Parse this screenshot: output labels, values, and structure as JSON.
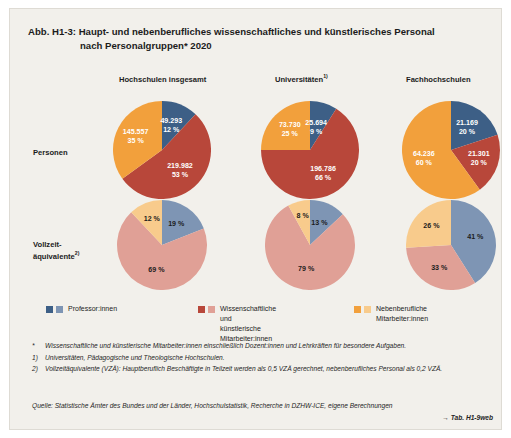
{
  "figure": {
    "number": "Abb. H1-3:",
    "title_line1": "Haupt- und nebenberufliches wissenschaftliches und künstlerisches Personal",
    "title_line2": "nach Personalgruppen* 2020"
  },
  "columns": [
    {
      "label": "Hochschulen insgesamt",
      "sup": ""
    },
    {
      "label": "Universitäten",
      "sup": "1)"
    },
    {
      "label": "Fachhochschulen",
      "sup": ""
    }
  ],
  "rows": [
    {
      "label_line1": "Personen",
      "label_line2": "",
      "sup": ""
    },
    {
      "label_line1": "Vollzeit-",
      "label_line2": "äquivalente",
      "sup": "2)"
    }
  ],
  "legend": [
    {
      "label": "Professor:innen",
      "color_dark": "#3d5f86",
      "color_light": "#7e95b4"
    },
    {
      "label": "Wissenschaftliche und\nkünstlerische Mitarbeiter:innen",
      "color_dark": "#b8473a",
      "color_light": "#e0a096"
    },
    {
      "label": "Nebenberufliche Mitarbeiter:innen",
      "color_dark": "#f2a03c",
      "color_light": "#f8cb8c"
    }
  ],
  "notes": [
    {
      "marker": "*",
      "text": "Wissenschaftliche und künstlerische Mitarbeiter:innen einschließlich Dozent:innen und Lehrkräften für besondere Aufgaben."
    },
    {
      "marker": "1)",
      "text": "Universitäten, Pädagogische und Theologische Hochschulen."
    },
    {
      "marker": "2)",
      "text": "Vollzeitäquivalente (VZÄ): Hauptberuflich Beschäftigte in Teilzeit werden als 0,5 VZÄ gerechnet, nebenberufliches Personal als 0,2 VZÄ."
    }
  ],
  "source": "Quelle: Statistische Ämter des Bundes und der Länder, Hochschulstatistik, Recherche in DZHW-ICE, eigene Berechnungen",
  "table_reference": "→ Tab. H1-9web",
  "chart_data": [
    {
      "type": "pie",
      "title": "Hochschulen insgesamt – Personen",
      "row": "Personen",
      "column": "Hochschulen insgesamt",
      "categories": [
        "Professor:innen",
        "Wissenschaftliche und künstlerische Mitarbeiter:innen",
        "Nebenberufliche Mitarbeiter:innen"
      ],
      "values": [
        49293,
        219982,
        145557
      ],
      "percentages": [
        12,
        53,
        35
      ],
      "value_labels": [
        "49.293",
        "219.982",
        "145.557"
      ],
      "percent_labels": [
        "12 %",
        "53 %",
        "35 %"
      ],
      "colors": [
        "#3d5f86",
        "#b8473a",
        "#f2a03c"
      ],
      "label_color": "#ffffff",
      "legend": "below"
    },
    {
      "type": "pie",
      "title": "Universitäten – Personen",
      "row": "Personen",
      "column": "Universitäten",
      "categories": [
        "Professor:innen",
        "Wissenschaftliche und künstlerische Mitarbeiter:innen",
        "Nebenberufliche Mitarbeiter:innen"
      ],
      "values": [
        25694,
        196786,
        73730
      ],
      "percentages": [
        9,
        66,
        25
      ],
      "value_labels": [
        "25.694",
        "196.786",
        "73.730"
      ],
      "percent_labels": [
        "9 %",
        "66 %",
        "25 %"
      ],
      "colors": [
        "#3d5f86",
        "#b8473a",
        "#f2a03c"
      ],
      "label_color": "#ffffff",
      "legend": "below"
    },
    {
      "type": "pie",
      "title": "Fachhochschulen – Personen",
      "row": "Personen",
      "column": "Fachhochschulen",
      "categories": [
        "Professor:innen",
        "Wissenschaftliche und künstlerische Mitarbeiter:innen",
        "Nebenberufliche Mitarbeiter:innen"
      ],
      "values": [
        21169,
        21301,
        64236
      ],
      "percentages": [
        20,
        20,
        60
      ],
      "value_labels": [
        "21.169",
        "21.301",
        "64.236"
      ],
      "percent_labels": [
        "20 %",
        "20 %",
        "60 %"
      ],
      "colors": [
        "#3d5f86",
        "#b8473a",
        "#f2a03c"
      ],
      "label_color": "#ffffff",
      "legend": "below"
    },
    {
      "type": "pie",
      "title": "Hochschulen insgesamt – Vollzeitäquivalente",
      "row": "Vollzeitäquivalente",
      "column": "Hochschulen insgesamt",
      "categories": [
        "Professor:innen",
        "Wissenschaftliche und künstlerische Mitarbeiter:innen",
        "Nebenberufliche Mitarbeiter:innen"
      ],
      "values": [
        19,
        69,
        12
      ],
      "percentages": [
        19,
        69,
        12
      ],
      "value_labels": [
        "",
        "",
        ""
      ],
      "percent_labels": [
        "19 %",
        "69 %",
        "12 %"
      ],
      "colors": [
        "#7e95b4",
        "#e0a096",
        "#f8cb8c"
      ],
      "label_color": "#1c1c1c",
      "legend": "below"
    },
    {
      "type": "pie",
      "title": "Universitäten – Vollzeitäquivalente",
      "row": "Vollzeitäquivalente",
      "column": "Universitäten",
      "categories": [
        "Professor:innen",
        "Wissenschaftliche und künstlerische Mitarbeiter:innen",
        "Nebenberufliche Mitarbeiter:innen"
      ],
      "values": [
        13,
        79,
        8
      ],
      "percentages": [
        13,
        79,
        8
      ],
      "value_labels": [
        "",
        "",
        ""
      ],
      "percent_labels": [
        "13 %",
        "79 %",
        "8 %"
      ],
      "colors": [
        "#7e95b4",
        "#e0a096",
        "#f8cb8c"
      ],
      "label_color": "#1c1c1c",
      "legend": "below"
    },
    {
      "type": "pie",
      "title": "Fachhochschulen – Vollzeitäquivalente",
      "row": "Vollzeitäquivalente",
      "column": "Fachhochschulen",
      "categories": [
        "Professor:innen",
        "Wissenschaftliche und künstlerische Mitarbeiter:innen",
        "Nebenberufliche Mitarbeiter:innen"
      ],
      "values": [
        41,
        33,
        26
      ],
      "percentages": [
        41,
        33,
        26
      ],
      "value_labels": [
        "",
        "",
        ""
      ],
      "percent_labels": [
        "41 %",
        "33 %",
        "26 %"
      ],
      "colors": [
        "#7e95b4",
        "#e0a096",
        "#f8cb8c"
      ],
      "label_color": "#1c1c1c",
      "legend": "below"
    }
  ]
}
